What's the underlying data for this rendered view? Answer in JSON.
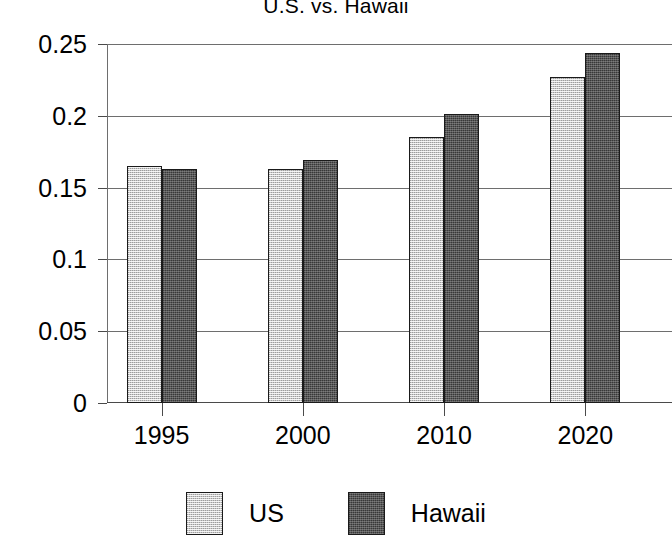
{
  "chart_data": {
    "type": "bar",
    "title": "U.S. vs. Hawaii",
    "xlabel": "",
    "ylabel": "",
    "categories": [
      "1995",
      "2000",
      "2010",
      "2020"
    ],
    "series": [
      {
        "name": "US",
        "values": [
          0.165,
          0.163,
          0.185,
          0.227
        ],
        "color": "#c9c9c9"
      },
      {
        "name": "Hawaii",
        "values": [
          0.163,
          0.169,
          0.201,
          0.244
        ],
        "color": "#565656"
      }
    ],
    "ylim": [
      0,
      0.25
    ],
    "yticks": [
      0,
      0.05,
      0.1,
      0.15,
      0.2,
      0.25
    ],
    "ytick_labels": [
      "0",
      "0.05",
      "0.1",
      "0.15",
      "0.2",
      "0.25"
    ],
    "grid": true,
    "legend_position": "bottom"
  },
  "legend": {
    "items": [
      {
        "label": "US"
      },
      {
        "label": "Hawaii"
      }
    ]
  }
}
